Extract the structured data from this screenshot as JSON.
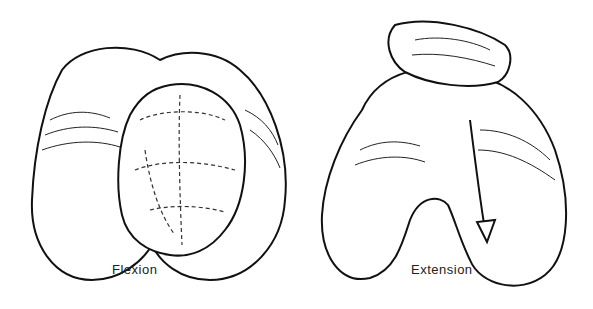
{
  "figure": {
    "left_panel": {
      "label": "Flexion"
    },
    "right_panel": {
      "label": "Extension"
    }
  }
}
